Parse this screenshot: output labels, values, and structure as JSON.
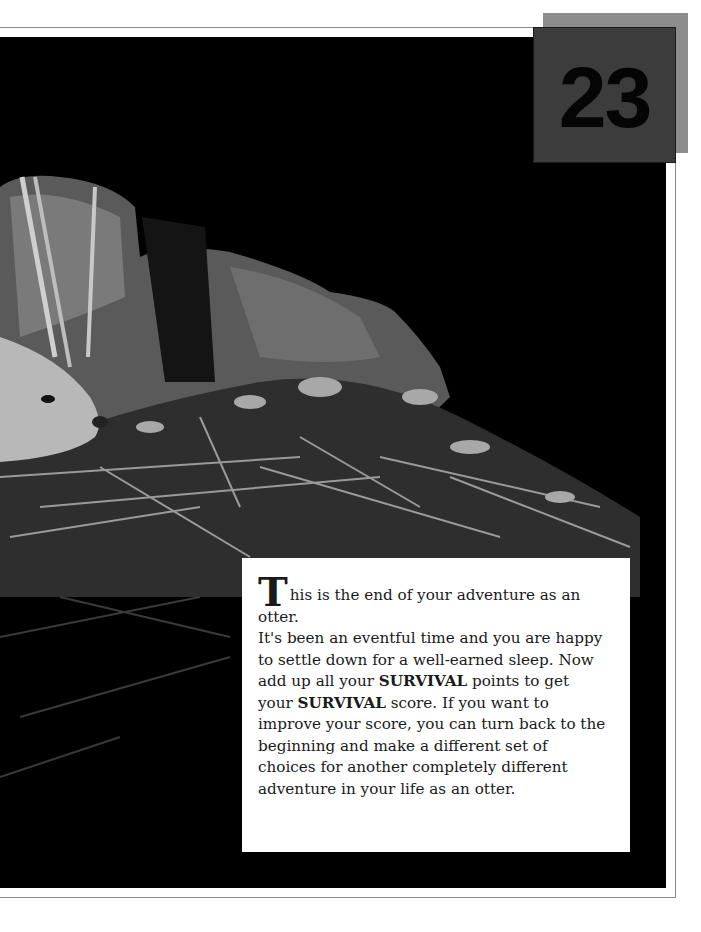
{
  "page": {
    "number": "23",
    "badge_colors": {
      "back": "#8c8c8c",
      "front": "#3c3c3c",
      "digits": "#050505"
    }
  },
  "photo": {
    "subject": "otter resting in a dark holt on a bed of twigs and leaves",
    "style": "black-and-white photograph"
  },
  "text_box": {
    "drop_cap": "T",
    "line1": "his is the end of your adventure as an otter.",
    "seg1": "It's been an eventful time and you are happy to settle down for a well-earned sleep. Now add up all your ",
    "bold1": "SURVIVAL",
    "seg2": " points to get your ",
    "bold2": "SURVIVAL",
    "seg3": " score. If you want to improve your score, you can turn back to the beginning and make a different set of choices for another completely different adventure in your life as an otter."
  }
}
